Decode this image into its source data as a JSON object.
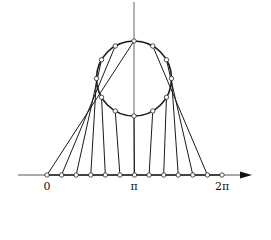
{
  "diagram": {
    "axis_labels": [
      "0",
      "π",
      "2π"
    ],
    "axis_ticks": 13,
    "circle_points": 12,
    "colors": {
      "stroke": "#1a1a1a",
      "axis": "#555555",
      "marker_fill": "#ffffff"
    }
  }
}
